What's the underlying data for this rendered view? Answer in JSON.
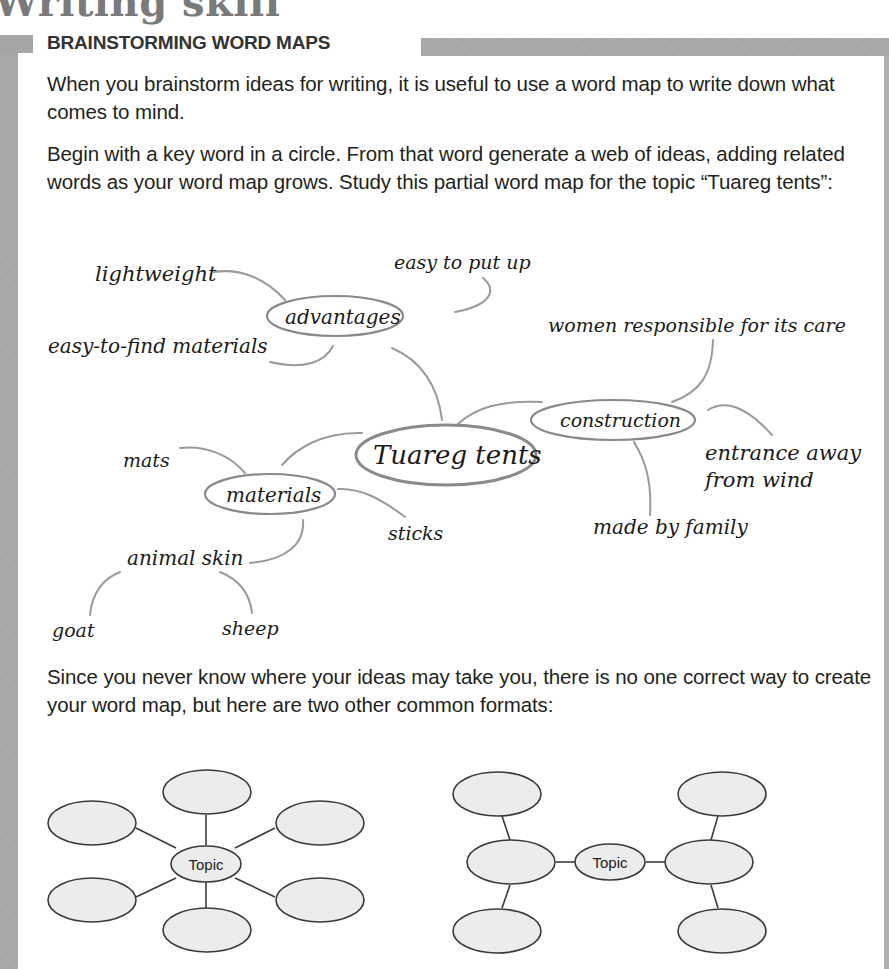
{
  "page": {
    "title": "Writing skill",
    "section_heading": "BRAINSTORMING WORD MAPS"
  },
  "paragraphs": [
    "When you brainstorm ideas for writing, it is useful to use a word map to write down what comes to mind.",
    "Begin with a key word in a circle. From that word generate a web of ideas, adding related words as your word map grows. Study this partial word map for the topic “Tuareg tents”:",
    "Since you never know where your ideas may take you, there is no one correct way to create your word map, but here are two other common formats:"
  ],
  "word_map": {
    "center": "Tuareg tents",
    "branches": [
      {
        "label": "advantages",
        "children": [
          "lightweight",
          "easy to put up",
          "easy-to-find materials"
        ]
      },
      {
        "label": "construction",
        "children": [
          "women responsible for its care",
          "entrance away from wind",
          "made by family"
        ]
      },
      {
        "label": "materials",
        "children": [
          "mats",
          "sticks",
          "animal skin"
        ]
      }
    ],
    "sub_branches": [
      {
        "parent": "animal skin",
        "children": [
          "goat",
          "sheep"
        ]
      }
    ],
    "labels": {
      "lightweight": "lightweight",
      "easy_to_put_up": "easy to put up",
      "advantages": "advantages",
      "easy_to_find": "easy-to-find materials",
      "women": "women responsible for its care",
      "construction": "construction",
      "center": "Tuareg tents",
      "entrance_1": "entrance away",
      "entrance_2": "from wind",
      "mats": "mats",
      "materials": "materials",
      "sticks": "sticks",
      "made_by_family": "made by family",
      "animal_skin": "animal skin",
      "goat": "goat",
      "sheep": "sheep"
    }
  },
  "formats": {
    "radial": {
      "center_label": "Topic",
      "outer_nodes": 6
    },
    "linear": {
      "center_label": "Topic",
      "outer_nodes": 6
    }
  },
  "colors": {
    "frame": "#a6a6a6",
    "connector": "#9a9a9a",
    "node_fill": "#ececec",
    "node_stroke": "#4a4a4a"
  }
}
